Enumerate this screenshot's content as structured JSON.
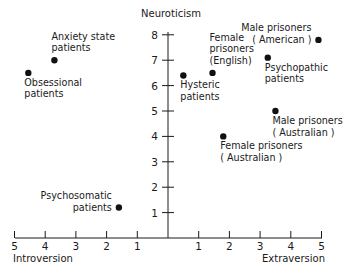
{
  "chart_data": {
    "type": "scatter",
    "title": "",
    "xlabel_left": "Introversion",
    "xlabel_right": "Extraversion",
    "ylabel": "Neuroticism",
    "xlim": [
      -5,
      5
    ],
    "ylim": [
      0,
      8
    ],
    "grid": false,
    "x_tick_labels": [
      "5",
      "4",
      "3",
      "2",
      "1",
      "1",
      "2",
      "3",
      "4",
      "5"
    ],
    "x_tick_values": [
      -5,
      -4,
      -3,
      -2,
      -1,
      1,
      2,
      3,
      4,
      5
    ],
    "y_tick_labels": [
      "1",
      "2",
      "3",
      "4",
      "5",
      "6",
      "7",
      "8"
    ],
    "y_tick_values": [
      1,
      2,
      3,
      4,
      5,
      6,
      7,
      8
    ],
    "points": [
      {
        "label": [
          "Obsessional",
          "patients"
        ],
        "x": -4.55,
        "y": 6.5,
        "label_pos": "below-left"
      },
      {
        "label": [
          "Anxiety state",
          "patients"
        ],
        "x": -3.7,
        "y": 7.0,
        "label_pos": "above"
      },
      {
        "label": [
          "Psychosomatic",
          "patients"
        ],
        "x": -1.6,
        "y": 1.2,
        "label_pos": "left"
      },
      {
        "label": [
          "Hysteric",
          "patients"
        ],
        "x": 0.5,
        "y": 6.4,
        "label_pos": "below"
      },
      {
        "label": [
          "Female",
          "prisoners",
          "(English)"
        ],
        "x": 1.45,
        "y": 6.5,
        "label_pos": "above"
      },
      {
        "label": [
          "Female prisoners",
          "( Australian )"
        ],
        "x": 1.8,
        "y": 4.0,
        "label_pos": "below"
      },
      {
        "label": [
          "Psychopathic",
          "patients"
        ],
        "x": 3.25,
        "y": 7.1,
        "label_pos": "below"
      },
      {
        "label": [
          "Male prisoners",
          "( Australian )"
        ],
        "x": 3.5,
        "y": 5.0,
        "label_pos": "below"
      },
      {
        "label": [
          "Male prisoners",
          "( American )"
        ],
        "x": 4.9,
        "y": 7.8,
        "label_pos": "left"
      }
    ]
  }
}
